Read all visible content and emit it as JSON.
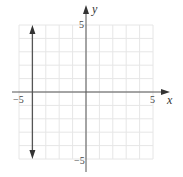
{
  "chart_data": {
    "type": "line",
    "title": "",
    "xlabel": "x",
    "ylabel": "y",
    "xlim": [
      -5,
      5
    ],
    "ylim": [
      -5,
      5
    ],
    "grid": true,
    "x_ticks_labeled": [
      "-5",
      "5"
    ],
    "y_ticks_labeled": [
      "5",
      "-5"
    ],
    "series": [
      {
        "name": "x = -4",
        "kind": "vertical-line",
        "x": -4,
        "y_range": [
          -5,
          5
        ],
        "arrows": "both"
      }
    ]
  },
  "labels": {
    "x_axis": "x",
    "y_axis": "y",
    "x_min": "−5",
    "x_max": "5",
    "y_max": "5",
    "y_min": "−5"
  },
  "colors": {
    "grid": "#e6e6e6",
    "axis": "#555555",
    "line": "#555555"
  }
}
